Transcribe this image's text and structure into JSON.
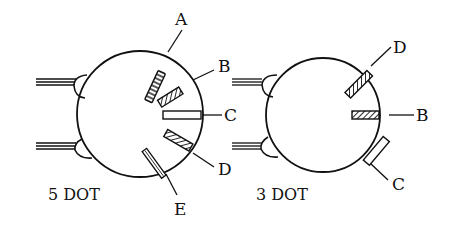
{
  "diagrams": [
    {
      "id": "five-dot",
      "caption": "5 DOT",
      "labels": {
        "A": "A",
        "B": "B",
        "C": "C",
        "D": "D",
        "E": "E"
      }
    },
    {
      "id": "three-dot",
      "caption": "3 DOT",
      "labels": {
        "D": "D",
        "B": "B",
        "C": "C"
      }
    }
  ],
  "colors": {
    "stroke": "#111111",
    "background": "#ffffff"
  }
}
